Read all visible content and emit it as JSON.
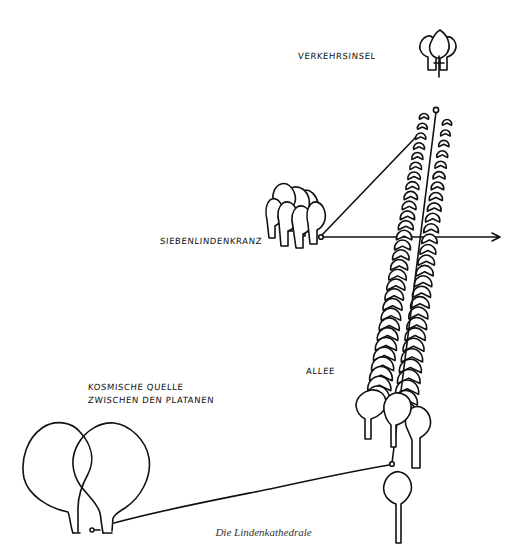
{
  "diagram": {
    "caption": "Die Lindenkathedrale",
    "labels": {
      "verkehrsinsel": "VERKEHRSINSEL",
      "siebenlindenkranz": "SIEBENLINDENKRANZ",
      "allee": "ALLEE",
      "kosmische_quelle_line1": "KOSMISCHE QUELLE",
      "kosmische_quelle_line2": "ZWISCHEN DEN PLATANEN"
    },
    "elements": [
      {
        "id": "verkehrsinsel",
        "type": "tree-group",
        "count": 3,
        "symbol": "cross"
      },
      {
        "id": "siebenlindenkranz",
        "type": "tree-cluster",
        "count": 7
      },
      {
        "id": "allee",
        "type": "double-row-of-trees"
      },
      {
        "id": "kosmische-quelle",
        "type": "two-overlapping-plane-trees"
      },
      {
        "id": "single-tree",
        "type": "tree"
      }
    ],
    "connections": [
      {
        "from": "siebenlindenkranz",
        "to": "allee-top",
        "style": "line"
      },
      {
        "from": "siebenlindenkranz",
        "to": "east",
        "style": "arrow"
      },
      {
        "from": "allee-top",
        "to": "allee-bottom",
        "style": "line"
      },
      {
        "from": "kosmische-quelle",
        "to": "allee-bottom",
        "style": "line"
      }
    ],
    "colors": {
      "ink": "#111111",
      "background": "#ffffff",
      "caption": "#333333"
    }
  }
}
